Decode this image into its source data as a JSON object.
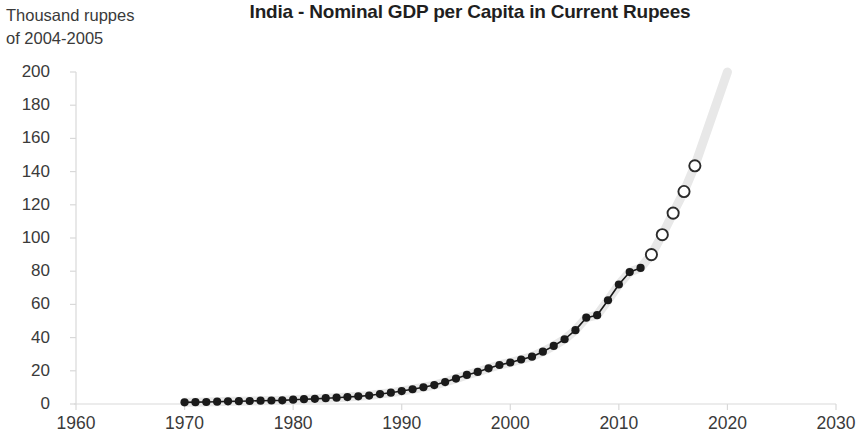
{
  "chart_data": {
    "type": "line",
    "title": "India - Nominal GDP per Capita in Current Rupees",
    "ylabel_caption_line1": "Thousand ruppes",
    "ylabel_caption_line2": "of 2004-2005",
    "xlabel": "",
    "ylabel": "Thousand ruppes of 2004-2005",
    "xlim": [
      1960,
      2030
    ],
    "ylim": [
      0,
      200
    ],
    "x_ticks": [
      1960,
      1970,
      1980,
      1990,
      2000,
      2010,
      2020,
      2030
    ],
    "y_ticks": [
      0,
      20,
      40,
      60,
      80,
      100,
      120,
      140,
      160,
      180,
      200
    ],
    "grid": false,
    "legend": "none",
    "colors": {
      "marker_actual": "#1a1a1a",
      "marker_projection_stroke": "#2b2b2b",
      "marker_projection_fill": "#ffffff",
      "trend_band": "#e8e8e8",
      "axis": "#d9d9d9",
      "text": "#3a3a3a",
      "title": "#1f1f1f"
    },
    "series": [
      {
        "name": "Actual (observed)",
        "marker": "filled-circle",
        "x": [
          1970,
          1971,
          1972,
          1973,
          1974,
          1975,
          1976,
          1977,
          1978,
          1979,
          1980,
          1981,
          1982,
          1983,
          1984,
          1985,
          1986,
          1987,
          1988,
          1989,
          1990,
          1991,
          1992,
          1993,
          1994,
          1995,
          1996,
          1997,
          1998,
          1999,
          2000,
          2001,
          2002,
          2003,
          2004,
          2005,
          2006,
          2007,
          2008,
          2009,
          2010,
          2011,
          2012
        ],
        "values": [
          1.0,
          1.1,
          1.2,
          1.4,
          1.6,
          1.7,
          1.8,
          2.0,
          2.1,
          2.2,
          2.6,
          2.9,
          3.1,
          3.5,
          3.8,
          4.2,
          4.6,
          5.1,
          6.0,
          6.8,
          7.8,
          8.9,
          10.1,
          11.4,
          13.2,
          15.3,
          17.5,
          19.3,
          21.5,
          23.5,
          25.0,
          26.8,
          28.5,
          31.5,
          35.0,
          39.0,
          44.5,
          52.0,
          53.5,
          62.5,
          72.0,
          79.5,
          82.0
        ]
      },
      {
        "name": "Projection",
        "marker": "hollow-circle",
        "x": [
          2013,
          2014,
          2015,
          2016,
          2017
        ],
        "values": [
          90.0,
          102.0,
          115.0,
          128.0,
          143.5
        ]
      }
    ],
    "trend_band": {
      "description": "light gray smoothed trend band extending through the projection to 2020 at ~200",
      "x_end": 2020,
      "y_end": 200
    }
  }
}
